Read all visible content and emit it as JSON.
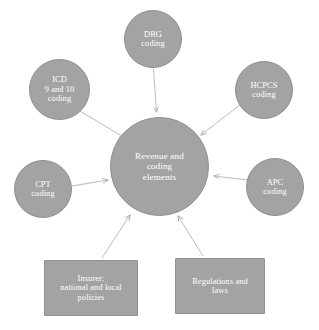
{
  "diagram": {
    "type": "hub-and-spoke",
    "background_color": "#ffffff",
    "node_fill_color": "#a3a3a3",
    "node_border_color": "#909090",
    "node_text_color": "#ffffff",
    "edge_color": "#b5b5b5",
    "center": {
      "id": "center",
      "shape": "circle",
      "label": "Revenue and\ncoding\nelements"
    },
    "nodes": [
      {
        "id": "drg",
        "shape": "circle",
        "label": "DRG\ncoding"
      },
      {
        "id": "icd",
        "shape": "circle",
        "label": "ICD\n9 and 10\ncoding"
      },
      {
        "id": "hcpcs",
        "shape": "circle",
        "label": "HCPCS\ncoding"
      },
      {
        "id": "cpt",
        "shape": "circle",
        "label": "CPT\ncoding"
      },
      {
        "id": "apc",
        "shape": "circle",
        "label": "APC\ncoding"
      },
      {
        "id": "insurer",
        "shape": "rectangle",
        "label": "Insurer:\nnational and local\npolicies"
      },
      {
        "id": "regulations",
        "shape": "rectangle",
        "label": "Regulations and\nlaws"
      }
    ],
    "edges": [
      {
        "from": "drg",
        "to": "center",
        "direction": "to-center"
      },
      {
        "from": "icd",
        "to": "center",
        "direction": "to-center"
      },
      {
        "from": "hcpcs",
        "to": "center",
        "direction": "to-center"
      },
      {
        "from": "cpt",
        "to": "center",
        "direction": "to-center"
      },
      {
        "from": "apc",
        "to": "center",
        "direction": "to-center"
      },
      {
        "from": "insurer",
        "to": "center",
        "direction": "to-center"
      },
      {
        "from": "regulations",
        "to": "center",
        "direction": "to-center"
      }
    ]
  }
}
